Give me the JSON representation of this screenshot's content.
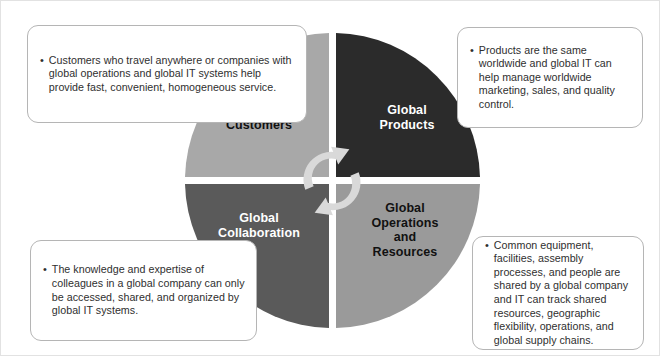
{
  "figure": {
    "colors": {
      "quadrant_global_customers": "#a8a8a8",
      "quadrant_global_products": "#2b2b2b",
      "quadrant_global_collaboration": "#5a5a5a",
      "quadrant_global_operations": "#9a9a9a",
      "callout_border": "#b5b5b5",
      "text": "#2f2f2f",
      "label_text": "#ffffff",
      "cycle_arrow": "#d6d6d6",
      "background": "#ffffff"
    },
    "center_icon": "circular-cycle-arrows-icon"
  },
  "quadrants": [
    {
      "id": "global-customers",
      "label": "Global\nCustomers",
      "position": "top-left",
      "fill": "#a8a8a8",
      "label_color": "#111111"
    },
    {
      "id": "global-products",
      "label": "Global\nProducts",
      "position": "top-right",
      "fill": "#2b2b2b",
      "label_color": "#ffffff"
    },
    {
      "id": "global-collaboration",
      "label": "Global\nCollaboration",
      "position": "bottom-left",
      "fill": "#5a5a5a",
      "label_color": "#ffffff"
    },
    {
      "id": "global-operations-and-resources",
      "label": "Global\nOperations\nand\nResources",
      "position": "bottom-right",
      "fill": "#9a9a9a",
      "label_color": "#111111"
    }
  ],
  "callouts": [
    {
      "id": "global-customers",
      "bullet": "•",
      "text": "Customers who travel anywhere or companies with global operations and global IT systems help provide fast, convenient, homogeneous service."
    },
    {
      "id": "global-products",
      "bullet": "•",
      "text": "Products are the same worldwide and global IT can help manage worldwide marketing, sales, and quality control."
    },
    {
      "id": "global-collaboration",
      "bullet": "•",
      "text": "The knowledge and expertise of colleagues in a global company can only be accessed, shared, and organized by global IT systems."
    },
    {
      "id": "global-operations-and-resources",
      "bullet": "•",
      "text": "Common equipment, facilities, assembly processes, and people are shared by a global company and IT can track shared resources, geographic flexibility, operations, and global supply chains."
    }
  ]
}
